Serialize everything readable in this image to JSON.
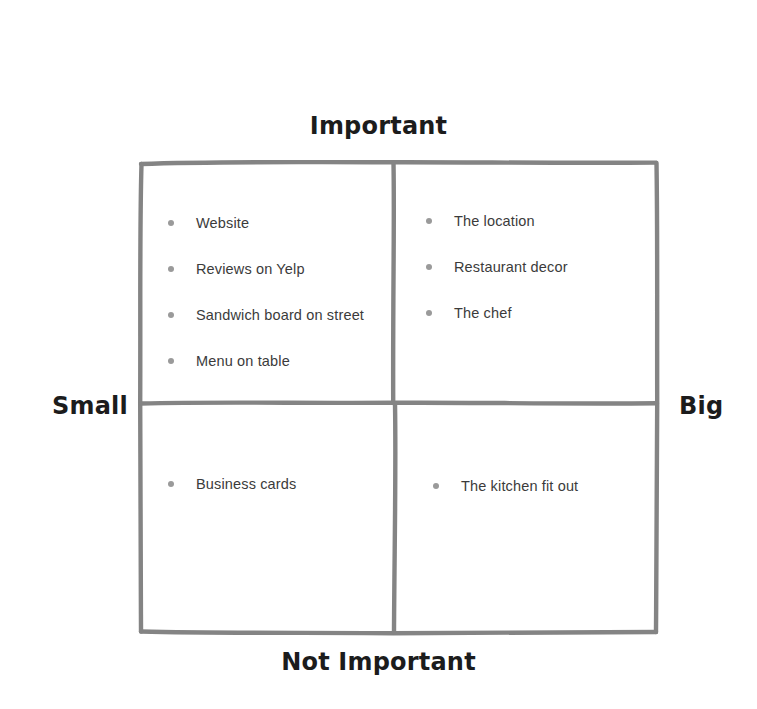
{
  "diagram": {
    "line_color": "#7a7a7a",
    "text_color": "#3b3b3b",
    "axis_label_color": "#1c1c1c",
    "bullet_color": "#9a9a9a",
    "background_color": "#ffffff"
  },
  "axes": {
    "top_label": "Important",
    "bottom_label": "Not Important",
    "left_label": "Small",
    "right_label": "Big"
  },
  "quadrants": [
    {
      "id": "small-important",
      "name": "Small / Important",
      "items": [
        "Website",
        "Reviews on Yelp",
        "Sandwich board on street",
        "Menu on table"
      ]
    },
    {
      "id": "big-important",
      "name": "Big / Important",
      "items": [
        "The location",
        "Restaurant decor",
        "The chef"
      ]
    },
    {
      "id": "small-not-important",
      "name": "Small / Not Important",
      "items": [
        "Business cards"
      ]
    },
    {
      "id": "big-not-important",
      "name": "Big / Not Important",
      "items": [
        "The kitchen fit out"
      ]
    }
  ]
}
